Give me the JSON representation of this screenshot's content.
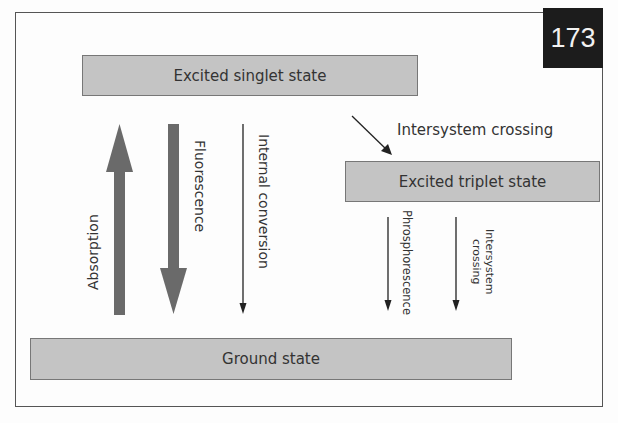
{
  "page_number": "173",
  "colors": {
    "state_box_fill": "#c4c4c4",
    "thick_arrow": "#6a6a6a",
    "thin_arrow": "#222222",
    "page_badge": "#1c1c1c"
  },
  "states": {
    "singlet": "Excited singlet state",
    "triplet": "Excited triplet state",
    "ground": "Ground state"
  },
  "transitions": {
    "absorption": "Absorption",
    "fluorescence": "Fluorescence",
    "internal_conversion": "Internal conversion",
    "intersystem_crossing_top": "Intersystem crossing",
    "phosphorescence": "Phrosphorescence",
    "intersystem_crossing_lower_line1": "Intersystem",
    "intersystem_crossing_lower_line2": "crossing"
  }
}
